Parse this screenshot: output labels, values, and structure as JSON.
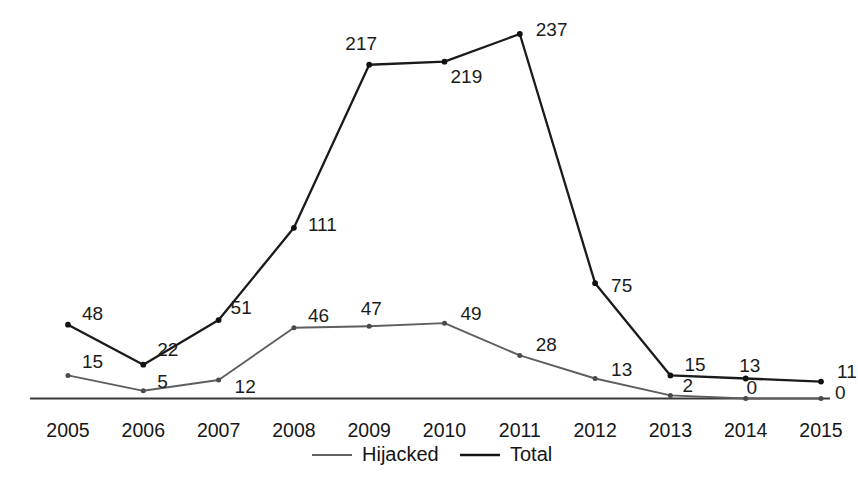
{
  "chart_data": {
    "type": "line",
    "title": "",
    "subtitle": "",
    "xlabel": "",
    "ylabel": "",
    "categories": [
      "2005",
      "2006",
      "2007",
      "2008",
      "2009",
      "2010",
      "2011",
      "2012",
      "2013",
      "2014",
      "2015"
    ],
    "series": [
      {
        "name": "Hijacked",
        "color": "#5e5e5e",
        "values": [
          15,
          5,
          12,
          46,
          47,
          49,
          28,
          13,
          2,
          0,
          0
        ],
        "labels": [
          "15",
          "5",
          "12",
          "46",
          "47",
          "49",
          "28",
          "13",
          "2",
          "0",
          "0"
        ]
      },
      {
        "name": "Total",
        "color": "#1a1a1a",
        "values": [
          48,
          22,
          51,
          111,
          217,
          219,
          237,
          75,
          15,
          13,
          11
        ],
        "labels": [
          "48",
          "22",
          "51",
          "111",
          "217",
          "219",
          "237",
          "75",
          "15",
          "13",
          "11"
        ]
      }
    ],
    "ylim": [
      0,
      237
    ],
    "xlim": [
      "2005",
      "2015"
    ],
    "grid": false,
    "y_axis_visible": false,
    "x_axis_visible": true,
    "legend_position": "bottom-center",
    "data_labels_shown": true,
    "markers": true
  },
  "legend": {
    "entries": [
      {
        "label": "Hijacked",
        "color": "#636363"
      },
      {
        "label": "Total",
        "color": "#141414"
      }
    ]
  },
  "axis": {
    "x_tick_labels": [
      "2005",
      "2006",
      "2007",
      "2008",
      "2009",
      "2010",
      "2011",
      "2012",
      "2013",
      "2014",
      "2015"
    ]
  }
}
